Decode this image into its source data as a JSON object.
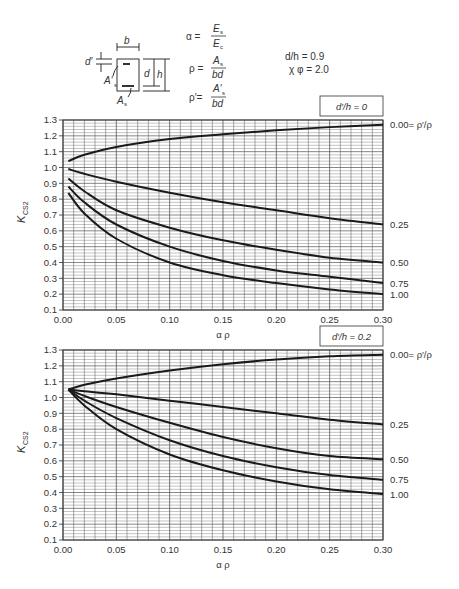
{
  "header": {
    "defs": {
      "alpha_lhs": "α =",
      "alpha_num": "E",
      "alpha_num_sub": "s",
      "alpha_den": "E",
      "alpha_den_sub": "c",
      "rho_lhs": "ρ =",
      "rho_num": "A",
      "rho_num_sub": "s",
      "rho_den": "bd",
      "rhop_lhs": "ρ′=",
      "rhop_num": "A′",
      "rhop_num_sub": "s",
      "rhop_den": "bd"
    },
    "params": {
      "dh": "d/h = 0.9",
      "xphi": "χ φ = 2.0"
    },
    "section_labels": {
      "b": "b",
      "dprime": "d′",
      "d": "d",
      "h": "h",
      "As_prime": "A′",
      "As_prime_sub": "s",
      "As": "A",
      "As_sub": "s"
    }
  },
  "chart_data": [
    {
      "type": "line",
      "title": "d′/h = 0",
      "xlabel": "α ρ",
      "ylabel": "K",
      "ylabel_sub": "CS2",
      "xlim": [
        0,
        0.3
      ],
      "ylim": [
        0.1,
        1.3
      ],
      "grid": true,
      "x_ticks": [
        "0.00",
        "0.05",
        "0.10",
        "0.15",
        "0.20",
        "0.25",
        "0.30"
      ],
      "y_ticks": [
        "0.1",
        "0.2",
        "0.3",
        "0.4",
        "0.5",
        "0.6",
        "0.7",
        "0.8",
        "0.9",
        "1.0",
        "1.1",
        "1.2",
        "1.3"
      ],
      "legend_note": "ρ′/ρ",
      "series": [
        {
          "name": "0.00",
          "label": "0.00= ρ′/ρ",
          "x": [
            0.005,
            0.02,
            0.05,
            0.1,
            0.15,
            0.2,
            0.25,
            0.3
          ],
          "y": [
            1.04,
            1.08,
            1.13,
            1.18,
            1.21,
            1.235,
            1.255,
            1.27
          ]
        },
        {
          "name": "0.25",
          "label": "0.25",
          "x": [
            0.005,
            0.02,
            0.05,
            0.1,
            0.15,
            0.2,
            0.25,
            0.3
          ],
          "y": [
            0.99,
            0.96,
            0.91,
            0.84,
            0.78,
            0.73,
            0.68,
            0.64
          ]
        },
        {
          "name": "0.50",
          "label": "0.50",
          "x": [
            0.005,
            0.02,
            0.05,
            0.1,
            0.15,
            0.2,
            0.25,
            0.3
          ],
          "y": [
            0.93,
            0.85,
            0.73,
            0.62,
            0.54,
            0.48,
            0.43,
            0.4
          ]
        },
        {
          "name": "0.75",
          "label": "0.75",
          "x": [
            0.005,
            0.02,
            0.05,
            0.1,
            0.15,
            0.2,
            0.25,
            0.3
          ],
          "y": [
            0.88,
            0.78,
            0.64,
            0.5,
            0.41,
            0.35,
            0.31,
            0.27
          ]
        },
        {
          "name": "1.00",
          "label": "1.00",
          "x": [
            0.005,
            0.02,
            0.05,
            0.1,
            0.15,
            0.2,
            0.25,
            0.3
          ],
          "y": [
            0.84,
            0.71,
            0.55,
            0.4,
            0.32,
            0.27,
            0.23,
            0.2
          ]
        }
      ]
    },
    {
      "type": "line",
      "title": "d′/h = 0.2",
      "xlabel": "α ρ",
      "ylabel": "K",
      "ylabel_sub": "CS2",
      "xlim": [
        0,
        0.3
      ],
      "ylim": [
        0.1,
        1.3
      ],
      "grid": true,
      "x_ticks": [
        "0.00",
        "0.05",
        "0.10",
        "0.15",
        "0.20",
        "0.25",
        "0.30"
      ],
      "y_ticks": [
        "0.1",
        "0.2",
        "0.3",
        "0.4",
        "0.5",
        "0.6",
        "0.7",
        "0.8",
        "0.9",
        "1.0",
        "1.1",
        "1.2",
        "1.3"
      ],
      "legend_note": "ρ′/ρ",
      "series": [
        {
          "name": "0.00",
          "label": "0.00= ρ′/ρ",
          "x": [
            0.005,
            0.02,
            0.05,
            0.1,
            0.15,
            0.2,
            0.25,
            0.3
          ],
          "y": [
            1.05,
            1.08,
            1.12,
            1.17,
            1.21,
            1.24,
            1.26,
            1.27
          ]
        },
        {
          "name": "0.25",
          "label": "0.25",
          "x": [
            0.005,
            0.02,
            0.05,
            0.1,
            0.15,
            0.2,
            0.25,
            0.3
          ],
          "y": [
            1.05,
            1.04,
            1.02,
            0.98,
            0.94,
            0.9,
            0.86,
            0.83
          ]
        },
        {
          "name": "0.50",
          "label": "0.50",
          "x": [
            0.005,
            0.02,
            0.05,
            0.1,
            0.15,
            0.2,
            0.25,
            0.3
          ],
          "y": [
            1.05,
            1.01,
            0.94,
            0.84,
            0.75,
            0.68,
            0.63,
            0.61
          ]
        },
        {
          "name": "0.75",
          "label": "0.75",
          "x": [
            0.005,
            0.02,
            0.05,
            0.1,
            0.15,
            0.2,
            0.25,
            0.3
          ],
          "y": [
            1.05,
            0.98,
            0.87,
            0.73,
            0.63,
            0.56,
            0.51,
            0.48
          ]
        },
        {
          "name": "1.00",
          "label": "1.00",
          "x": [
            0.005,
            0.02,
            0.05,
            0.1,
            0.15,
            0.2,
            0.25,
            0.3
          ],
          "y": [
            1.05,
            0.95,
            0.8,
            0.64,
            0.54,
            0.47,
            0.42,
            0.39
          ]
        }
      ]
    }
  ]
}
